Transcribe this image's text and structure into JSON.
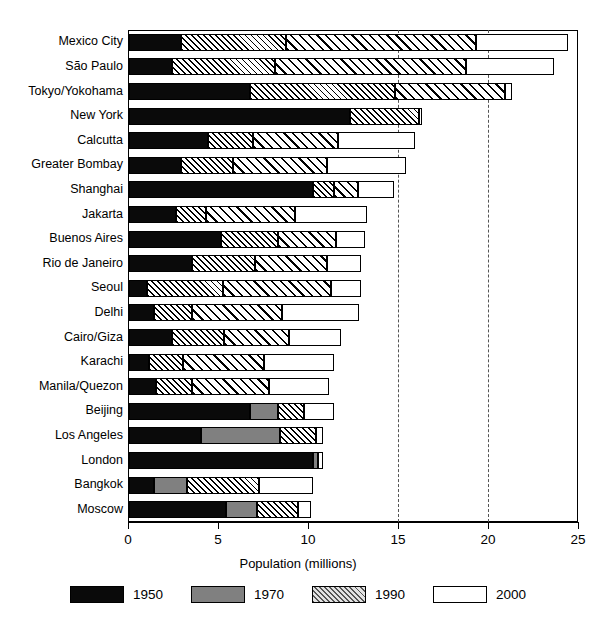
{
  "chart_data": {
    "type": "bar",
    "subtype": "stacked-horizontal",
    "title": "",
    "xlabel": "Population (millions)",
    "ylabel": "",
    "xlim": [
      0,
      25
    ],
    "xticks": [
      0,
      5,
      10,
      15,
      20,
      25
    ],
    "xtick_labels": [
      "0",
      "5",
      "10",
      "15",
      "20",
      "25"
    ],
    "grid": "dashed vertical gridlines at 15 and 20",
    "gridlines": [
      15,
      20
    ],
    "legend_position": "below-axis-centered",
    "orientation": "horizontal",
    "categories": [
      "Mexico City",
      "São Paulo",
      "Tokyo/Yokohama",
      "New York",
      "Calcutta",
      "Greater Bombay",
      "Shanghai",
      "Jakarta",
      "Buenos Aires",
      "Rio de Janeiro",
      "Seoul",
      "Delhi",
      "Cairo/Giza",
      "Karachi",
      "Manila/Quezon",
      "Beijing",
      "Los Angeles",
      "London",
      "Bangkok",
      "Moscow"
    ],
    "series": [
      {
        "name": "1950",
        "color": "#0a0a0a",
        "values": [
          2.9,
          2.4,
          6.7,
          12.3,
          4.4,
          2.9,
          10.2,
          2.0,
          5.0,
          2.9,
          1.0,
          1.4,
          2.4,
          1.0,
          1.5,
          6.7,
          4.0,
          10.2,
          1.4,
          5.4
        ]
      },
      {
        "name": "1970",
        "color": "#808080",
        "values": [
          0,
          0,
          0,
          0,
          0,
          0,
          0,
          0,
          0,
          0,
          0,
          0,
          0,
          0,
          0,
          8.3,
          8.4,
          10.5,
          3.2,
          7.1
        ]
      },
      {
        "name": "1990",
        "color": "hatched",
        "values": [
          15.1,
          14.8,
          14.7,
          16.1,
          11.0,
          12.2,
          13.4,
          9.2,
          11.5,
          10.7,
          11.0,
          8.2,
          8.6,
          7.7,
          7.8,
          9.7,
          10.4,
          10.6,
          7.2,
          9.4
        ]
      },
      {
        "name": "2000",
        "color": "#ffffff",
        "values": [
          24.4,
          23.6,
          21.3,
          16.3,
          15.9,
          15.4,
          14.7,
          13.2,
          13.1,
          12.9,
          12.9,
          12.8,
          11.8,
          11.4,
          11.1,
          11.4,
          10.8,
          10.8,
          10.2,
          10.1
        ]
      }
    ],
    "series_labels": [
      "1950",
      "1970",
      "1990",
      "2000"
    ],
    "bars": [
      {
        "label": "Mexico City",
        "s1950": 2.9,
        "s1970": null,
        "s1990a": 8.7,
        "s1990b": 19.3,
        "s2000": 24.4
      },
      {
        "label": "São Paulo",
        "s1950": 2.4,
        "s1970": null,
        "s1990a": 8.1,
        "s1990b": 18.7,
        "s2000": 23.6
      },
      {
        "label": "Tokyo/Yokohama",
        "s1950": 6.7,
        "s1970": null,
        "s1990a": 14.8,
        "s1990b": 20.9,
        "s2000": 21.3
      },
      {
        "label": "New York",
        "s1950": 12.3,
        "s1970": null,
        "s1990a": 16.1,
        "s1990b": 16.1,
        "s2000": 16.3
      },
      {
        "label": "Calcutta",
        "s1950": 4.4,
        "s1970": null,
        "s1990a": 6.9,
        "s1990b": 11.6,
        "s2000": 15.9
      },
      {
        "label": "Greater Bombay",
        "s1950": 2.9,
        "s1970": null,
        "s1990a": 5.8,
        "s1990b": 11.0,
        "s2000": 15.4
      },
      {
        "label": "Shanghai",
        "s1950": 10.2,
        "s1970": null,
        "s1990a": 11.4,
        "s1990b": 12.7,
        "s2000": 14.7
      },
      {
        "label": "Jakarta",
        "s1950": 2.6,
        "s1970": null,
        "s1990a": 4.3,
        "s1990b": 9.2,
        "s2000": 13.2
      },
      {
        "label": "Buenos Aires",
        "s1950": 5.1,
        "s1970": null,
        "s1990a": 8.3,
        "s1990b": 11.5,
        "s2000": 13.1
      },
      {
        "label": "Rio de Janeiro",
        "s1950": 3.5,
        "s1970": null,
        "s1990a": 7.0,
        "s1990b": 11.0,
        "s2000": 12.9
      },
      {
        "label": "Seoul",
        "s1950": 1.0,
        "s1970": null,
        "s1990a": 5.2,
        "s1990b": 11.2,
        "s2000": 12.9
      },
      {
        "label": "Delhi",
        "s1950": 1.4,
        "s1970": null,
        "s1990a": 3.5,
        "s1990b": 8.5,
        "s2000": 12.8
      },
      {
        "label": "Cairo/Giza",
        "s1950": 2.4,
        "s1970": null,
        "s1990a": 5.3,
        "s1990b": 8.9,
        "s2000": 11.8
      },
      {
        "label": "Karachi",
        "s1950": 1.1,
        "s1970": null,
        "s1990a": 3.0,
        "s1990b": 7.5,
        "s2000": 11.4
      },
      {
        "label": "Manila/Quezon",
        "s1950": 1.5,
        "s1970": null,
        "s1990a": 3.5,
        "s1990b": 7.8,
        "s2000": 11.1
      },
      {
        "label": "Beijing",
        "s1950": 6.7,
        "s1970": 8.3,
        "s1990a": 9.7,
        "s1990b": null,
        "s2000": 11.4
      },
      {
        "label": "Los Angeles",
        "s1950": 4.0,
        "s1970": 8.4,
        "s1990a": 10.4,
        "s1990b": null,
        "s2000": 10.8
      },
      {
        "label": "London",
        "s1950": 10.2,
        "s1970": 10.5,
        "s1990a": null,
        "s1990b": null,
        "s2000": 10.8
      },
      {
        "label": "Bangkok",
        "s1950": 1.4,
        "s1970": 3.2,
        "s1990a": 7.2,
        "s1990b": null,
        "s2000": 10.2
      },
      {
        "label": "Moscow",
        "s1950": 5.4,
        "s1970": 7.1,
        "s1990a": 9.4,
        "s1990b": null,
        "s2000": 10.1
      }
    ]
  },
  "axis": {
    "title": "Population (millions)",
    "ticks": [
      "0",
      "5",
      "10",
      "15",
      "20",
      "25"
    ]
  },
  "legend": {
    "items": [
      {
        "label": "1950",
        "swatch": "s1950"
      },
      {
        "label": "1970",
        "swatch": "s1970"
      },
      {
        "label": "1990",
        "swatch": "s1990"
      },
      {
        "label": "2000",
        "swatch": "s2000"
      }
    ]
  }
}
